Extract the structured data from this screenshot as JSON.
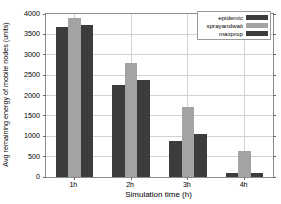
{
  "chart_data": {
    "type": "bar",
    "title": "",
    "xlabel": "Simulation time (h)",
    "ylabel": "Avg remaining energy of mobile nodes (units)",
    "categories": [
      "1h",
      "2h",
      "3h",
      "4h"
    ],
    "series": [
      {
        "name": "epidemic",
        "values": [
          3680,
          2270,
          890,
          90
        ],
        "color": "#3c3c3c"
      },
      {
        "name": "sprayandwait",
        "values": [
          3900,
          2810,
          1730,
          650
        ],
        "color": "#a3a3a3"
      },
      {
        "name": "maxprop",
        "values": [
          3720,
          2380,
          1050,
          110
        ],
        "color": "#3c3c3c"
      }
    ],
    "ylim": [
      0,
      4000
    ],
    "yticks": [
      0,
      500,
      1000,
      1500,
      2000,
      2500,
      3000,
      3500,
      4000
    ],
    "ytick_labels": [
      "0",
      "500",
      "1000",
      "1500",
      "2000",
      "2500",
      "3000",
      "3500",
      "4000"
    ],
    "grid": true,
    "grid_color": "#d2d2d2",
    "legend_position": "top-right",
    "axis_color": "#8c8c8c",
    "background": "#ffffff"
  },
  "legend": {
    "items": [
      {
        "label": "epidemic"
      },
      {
        "label": "sprayandwait"
      },
      {
        "label": "maxprop"
      }
    ]
  },
  "axes": {
    "y_title": "Avg remaining energy of mobile nodes (units)",
    "x_title": "Simulation time (h)"
  }
}
